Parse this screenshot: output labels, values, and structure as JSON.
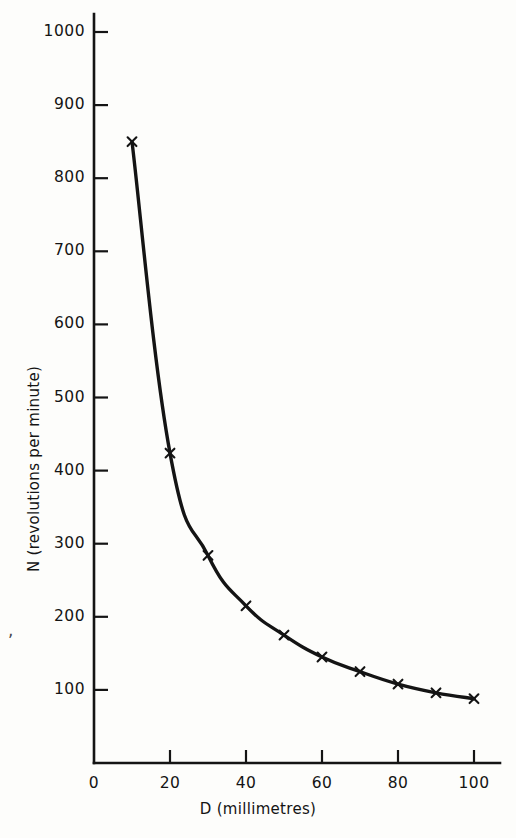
{
  "figure": {
    "background_color": "#fdfdfb",
    "ink_color": "#141414",
    "stray_comma": ","
  },
  "chart_data": {
    "type": "line",
    "title": "",
    "subtitle": "",
    "xlabel": "D (millimetres)",
    "ylabel": "N (revolutions per minute)",
    "xlim": [
      0,
      100
    ],
    "ylim": [
      0,
      1000
    ],
    "xticks": [
      0,
      20,
      40,
      60,
      80,
      100
    ],
    "yticks": [
      100,
      200,
      300,
      400,
      500,
      600,
      700,
      800,
      900,
      1000
    ],
    "xtick_labels": [
      "0",
      "20",
      "40",
      "60",
      "80",
      "100"
    ],
    "ytick_labels": [
      "100",
      "200",
      "300",
      "400",
      "500",
      "600",
      "700",
      "800",
      "900",
      "1000"
    ],
    "grid": false,
    "legend": false,
    "legend_position": "none",
    "marker": "x",
    "line_style": "solid-hand-drawn",
    "series": [
      {
        "name": "N vs D",
        "x": [
          10,
          20,
          30,
          40,
          50,
          60,
          70,
          80,
          90,
          100
        ],
        "values": [
          850,
          424,
          284,
          215,
          175,
          145,
          125,
          108,
          96,
          88
        ]
      }
    ],
    "annotations": []
  },
  "xticks": [
    {
      "label": "0",
      "value": 0
    },
    {
      "label": "20",
      "value": 20
    },
    {
      "label": "40",
      "value": 40
    },
    {
      "label": "60",
      "value": 60
    },
    {
      "label": "80",
      "value": 80
    },
    {
      "label": "100",
      "value": 100
    }
  ],
  "yticks": [
    {
      "label": "1000",
      "value": 1000
    },
    {
      "label": "900",
      "value": 900
    },
    {
      "label": "800",
      "value": 800
    },
    {
      "label": "700",
      "value": 700
    },
    {
      "label": "600",
      "value": 600
    },
    {
      "label": "500",
      "value": 500
    },
    {
      "label": "400",
      "value": 400
    },
    {
      "label": "300",
      "value": 300
    },
    {
      "label": "200",
      "value": 200
    },
    {
      "label": "100",
      "value": 100
    }
  ]
}
